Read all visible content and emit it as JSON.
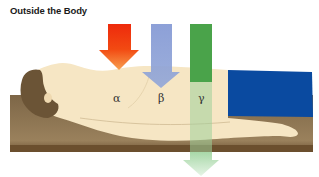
{
  "title": "Outside the Body",
  "radiation_labels": {
    "alpha": "α",
    "beta": "β",
    "gamma": "γ"
  },
  "colors": {
    "alpha_arrow": "#f03a10",
    "beta_arrow": "#8a9fd6",
    "gamma_arrow": "#4aa34a",
    "skin": "#f6e6c4",
    "hair": "#6b5436",
    "platform": "#8b7452",
    "pants": "#0a4aa0"
  }
}
